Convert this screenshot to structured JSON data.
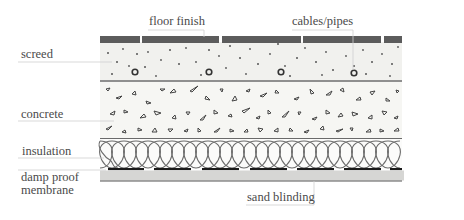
{
  "diagram": {
    "type": "floor cross-section",
    "labels": {
      "floor_finish": "floor finish",
      "cables_pipes": "cables/pipes",
      "screed": "screed",
      "concrete": "concrete",
      "insulation": "insulation",
      "dpm_line1": "damp proof",
      "dpm_line2": "membrane",
      "sand_blinding": "sand blinding"
    },
    "layers": [
      {
        "name": "floor finish",
        "color": "#5c5c5c"
      },
      {
        "name": "screed",
        "color": "#f1f1ee"
      },
      {
        "name": "concrete",
        "color": "#f6f6f3"
      },
      {
        "name": "insulation",
        "color": "#fbfbfa"
      },
      {
        "name": "damp proof membrane",
        "color": "#1a1a1a"
      },
      {
        "name": "sand blinding",
        "color": "#d6d6d4"
      }
    ]
  }
}
